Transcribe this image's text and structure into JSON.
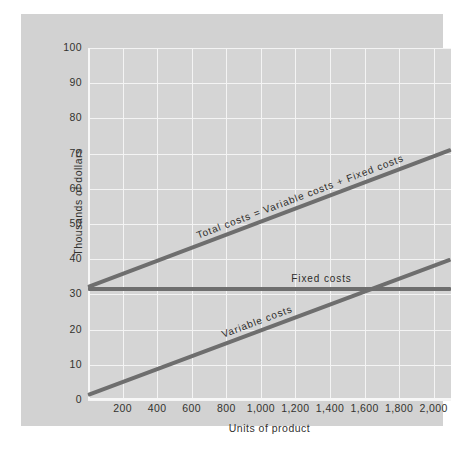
{
  "chart_data": {
    "type": "line",
    "title": "",
    "subtitle": "",
    "xlabel": "Units of product",
    "ylabel": "Thousands of dollars",
    "xlim": [
      0,
      2100
    ],
    "ylim": [
      0,
      100
    ],
    "xticks": [
      200,
      400,
      600,
      800,
      1000,
      1200,
      1400,
      1600,
      1800,
      2000
    ],
    "xticklabels": [
      "200",
      "400",
      "600",
      "800",
      "1,000",
      "1,200",
      "1,400",
      "1,600",
      "1,800",
      "2,000"
    ],
    "yticks": [
      0,
      10,
      20,
      30,
      40,
      50,
      60,
      70,
      80,
      90,
      100
    ],
    "yticklabels": [
      "0",
      "10",
      "20",
      "30",
      "40",
      "50",
      "60",
      "70",
      "80",
      "90",
      "100"
    ],
    "grid": true,
    "legend_position": "inline-annotations",
    "series": [
      {
        "name": "Total costs = Variable costs + Fixed costs",
        "label": "Total costs = Variable costs + Fixed costs",
        "x": [
          0,
          2100
        ],
        "values": [
          32,
          71
        ],
        "color": "#6e6e6e"
      },
      {
        "name": "Fixed costs",
        "label": "Fixed costs",
        "x": [
          0,
          2100
        ],
        "values": [
          31.5,
          31.5
        ],
        "color": "#6e6e6e"
      },
      {
        "name": "Variable costs",
        "label": "Variable costs",
        "x": [
          0,
          2100
        ],
        "values": [
          1.5,
          40
        ],
        "color": "#6e6e6e"
      }
    ],
    "annotations": [
      {
        "text": "Total costs = Variable costs + Fixed costs",
        "series": "Total costs = Variable costs + Fixed costs"
      },
      {
        "text": "Fixed costs",
        "series": "Fixed costs"
      },
      {
        "text": "Variable costs",
        "series": "Variable costs"
      }
    ],
    "colors": {
      "line": "#6e6e6e",
      "panel_background": "#d2d2d2",
      "plot_background": "#d5d5d5",
      "gridline": "#f4f4f4",
      "text": "#33322f",
      "figure_background": "#ffffff"
    }
  }
}
